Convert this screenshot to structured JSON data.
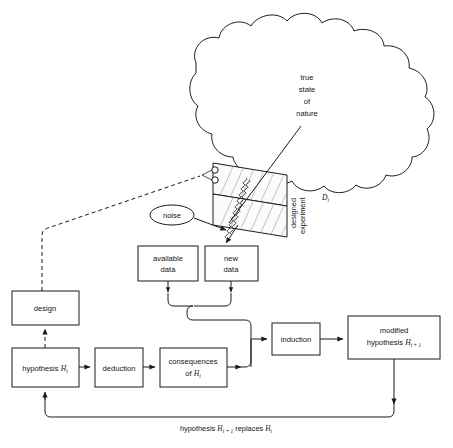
{
  "figure": {
    "caption_partial": ""
  },
  "cloud": {
    "name": "true-state-of-nature",
    "lines": [
      "true",
      "state",
      "of",
      "nature"
    ]
  },
  "experiment": {
    "label_line1": "designed",
    "label_line2": "experiment",
    "symbol": "D",
    "symbol_sub": "i"
  },
  "noise": {
    "label": "noise"
  },
  "boxes": [
    {
      "id": "available-data",
      "lines": [
        "available",
        "data"
      ]
    },
    {
      "id": "new-data",
      "lines": [
        "new",
        "data"
      ]
    },
    {
      "id": "design",
      "lines": [
        "design"
      ]
    },
    {
      "id": "hypothesis",
      "text": "hypothesis",
      "symbol": "H",
      "symbol_sub": "i"
    },
    {
      "id": "deduction",
      "lines": [
        "deduction"
      ]
    },
    {
      "id": "consequences",
      "line1": "consequences",
      "line2_prefix": "of",
      "symbol": "H",
      "symbol_sub": "i"
    },
    {
      "id": "induction",
      "lines": [
        "induction"
      ]
    },
    {
      "id": "modified-hypothesis",
      "line1": "modified",
      "line2_prefix": "hypothesis",
      "symbol": "H",
      "symbol_sub": "i + 1"
    }
  ],
  "feedback": {
    "prefix": "hypothesis",
    "symbol1": "H",
    "symbol1_sub": "i + 1",
    "middle": "replaces",
    "symbol2": "H",
    "symbol2_sub": "i"
  },
  "colors": {
    "ink": "#1a1a1a",
    "paper": "#ffffff",
    "hatch": "#9a9a9a"
  }
}
